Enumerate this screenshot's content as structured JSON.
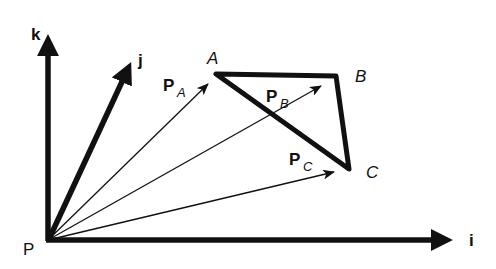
{
  "diagram": {
    "origin_label": "P",
    "axes": {
      "i": "i",
      "j": "j",
      "k": "k"
    },
    "points": {
      "A": "A",
      "B": "B",
      "C": "C"
    },
    "vectors": {
      "PA": {
        "main": "P",
        "sub": "A"
      },
      "PB": {
        "main": "P",
        "sub": "B"
      },
      "PC": {
        "main": "P",
        "sub": "C"
      }
    },
    "colors": {
      "stroke": "#111111",
      "background": "#ffffff"
    }
  }
}
